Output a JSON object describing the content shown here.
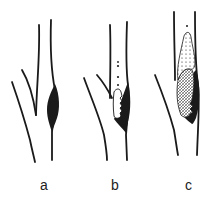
{
  "figure": {
    "colors": {
      "ink": "#1a1a1a",
      "background": "#ffffff"
    },
    "panels": [
      {
        "id": "a",
        "label": "a"
      },
      {
        "id": "b",
        "label": "b"
      },
      {
        "id": "c",
        "label": "c"
      }
    ]
  }
}
